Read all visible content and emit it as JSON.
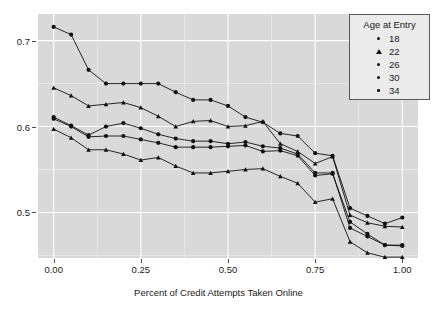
{
  "chart_data": {
    "type": "line",
    "title": "",
    "xlabel": "Percent of Credit Attempts Taken Online",
    "ylabel": "",
    "xlim": [
      -0.045,
      1.045
    ],
    "ylim": [
      0.447,
      0.731
    ],
    "xticks": [
      0.0,
      0.25,
      0.5,
      0.75,
      1.0
    ],
    "xticklabels": [
      "0.00",
      "0.25",
      "0.50",
      "0.75",
      "1.00"
    ],
    "yticks": [
      0.5,
      0.6,
      0.7
    ],
    "yticklabels": [
      "0.5",
      "0.6",
      "0.7"
    ],
    "grid": true,
    "grid_color": "#ffffff",
    "panel_color": "#d9d9d9",
    "legend": {
      "title": "Age at Entry",
      "position": "top-right",
      "entries": [
        {
          "label": "18",
          "marker": "circle"
        },
        {
          "label": "22",
          "marker": "triangle"
        },
        {
          "label": "26",
          "marker": "circle"
        },
        {
          "label": "30",
          "marker": "circle"
        },
        {
          "label": "34",
          "marker": "circle"
        }
      ]
    },
    "x": [
      0.0,
      0.05,
      0.1,
      0.15,
      0.2,
      0.25,
      0.3,
      0.35,
      0.4,
      0.45,
      0.5,
      0.55,
      0.6,
      0.65,
      0.7,
      0.75,
      0.8,
      0.85,
      0.9,
      0.95,
      1.0
    ],
    "series": [
      {
        "name": "18",
        "marker": "circle",
        "color": "#111111",
        "values": [
          0.716,
          0.707,
          0.666,
          0.65,
          0.65,
          0.65,
          0.65,
          0.64,
          0.631,
          0.631,
          0.624,
          0.611,
          0.605,
          0.592,
          0.589,
          0.569,
          0.566,
          0.505,
          0.496,
          0.487,
          0.494
        ]
      },
      {
        "name": "22",
        "marker": "triangle",
        "color": "#111111",
        "values": [
          0.645,
          0.636,
          0.624,
          0.626,
          0.628,
          0.622,
          0.612,
          0.6,
          0.606,
          0.607,
          0.6,
          0.601,
          0.606,
          0.58,
          0.571,
          0.557,
          0.565,
          0.497,
          0.488,
          0.484,
          0.483
        ]
      },
      {
        "name": "26",
        "marker": "circle",
        "color": "#111111",
        "values": [
          0.611,
          0.601,
          0.59,
          0.6,
          0.604,
          0.598,
          0.591,
          0.586,
          0.583,
          0.583,
          0.58,
          0.582,
          0.577,
          0.575,
          0.568,
          0.546,
          0.546,
          0.482,
          0.472,
          0.462,
          0.462
        ]
      },
      {
        "name": "30",
        "marker": "circle",
        "color": "#111111",
        "values": [
          0.609,
          0.6,
          0.588,
          0.589,
          0.589,
          0.585,
          0.581,
          0.576,
          0.576,
          0.576,
          0.577,
          0.578,
          0.571,
          0.572,
          0.566,
          0.543,
          0.545,
          0.489,
          0.475,
          0.462,
          0.461
        ]
      },
      {
        "name": "34",
        "marker": "triangle",
        "color": "#111111",
        "values": [
          0.597,
          0.587,
          0.573,
          0.573,
          0.568,
          0.561,
          0.564,
          0.554,
          0.546,
          0.546,
          0.548,
          0.55,
          0.551,
          0.542,
          0.534,
          0.512,
          0.516,
          0.466,
          0.453,
          0.448,
          0.448
        ]
      }
    ]
  }
}
